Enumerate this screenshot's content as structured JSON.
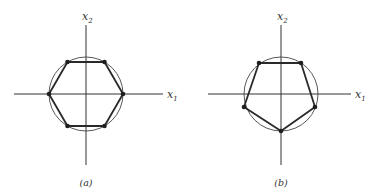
{
  "panels": [
    {
      "id": "a",
      "caption": "(a)",
      "axis_x_label": "x",
      "axis_x_sub": "1",
      "axis_y_label": "x",
      "axis_y_sub": "2",
      "shape": "hexagon",
      "vertices": 6
    },
    {
      "id": "b",
      "caption": "(b)",
      "axis_x_label": "x",
      "axis_x_sub": "1",
      "axis_y_label": "x",
      "axis_y_sub": "2",
      "shape": "pentagon",
      "vertices": 5
    }
  ]
}
